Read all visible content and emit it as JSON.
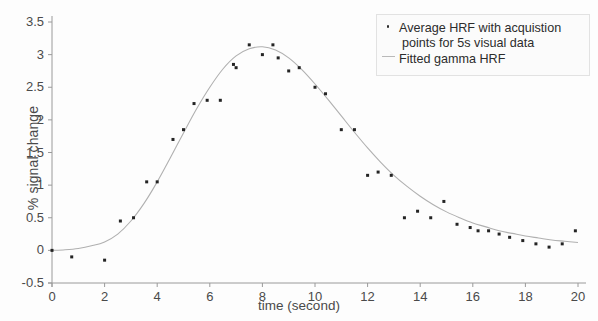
{
  "chart_data": {
    "type": "scatter",
    "title": "",
    "xlabel": "time (second)",
    "ylabel": "% signal change",
    "xlim": [
      0,
      20
    ],
    "ylim": [
      -0.5,
      3.5
    ],
    "xticks": [
      0,
      2,
      4,
      6,
      8,
      10,
      12,
      14,
      16,
      18,
      20
    ],
    "xtick_labels": [
      "0",
      "2",
      "4",
      "6",
      "8",
      "10",
      "12",
      "14",
      "16",
      "18",
      "20"
    ],
    "yticks": [
      -0.5,
      0,
      0.5,
      1,
      1.5,
      2,
      2.5,
      3,
      3.5
    ],
    "ytick_labels": [
      "-0.5",
      "0",
      "0.5",
      "1",
      "1.5",
      "2",
      "2.5",
      "3",
      "3.5"
    ],
    "grid": false,
    "legend_position": "upper right",
    "series": [
      {
        "name": "Average HRF with acquistion points for 5s visual data",
        "type": "scatter",
        "marker": "point",
        "color": "#242424",
        "x": [
          0.0,
          0.75,
          2.0,
          2.6,
          3.1,
          3.6,
          4.0,
          4.6,
          5.0,
          5.4,
          5.9,
          6.4,
          6.9,
          7.0,
          7.5,
          8.0,
          8.4,
          8.6,
          9.0,
          9.4,
          10.0,
          10.4,
          11.0,
          11.5,
          12.0,
          12.4,
          12.9,
          13.4,
          13.9,
          14.4,
          14.9,
          15.4,
          15.9,
          16.2,
          16.6,
          17.0,
          17.4,
          17.9,
          18.4,
          18.9,
          19.4,
          19.9
        ],
        "y": [
          0.0,
          -0.1,
          -0.15,
          0.45,
          0.5,
          1.05,
          1.05,
          1.7,
          1.85,
          2.25,
          2.3,
          2.3,
          2.85,
          2.8,
          3.15,
          3.0,
          3.15,
          2.95,
          2.75,
          2.8,
          2.5,
          2.4,
          1.85,
          1.85,
          1.15,
          1.2,
          1.15,
          0.5,
          0.6,
          0.5,
          0.75,
          0.4,
          0.35,
          0.3,
          0.3,
          0.25,
          0.2,
          0.15,
          0.1,
          0.05,
          0.1,
          0.3
        ]
      },
      {
        "name": "Fitted gamma HRF",
        "type": "line",
        "color": "#b0b0b0",
        "x": [
          0.0,
          0.5,
          1.0,
          1.5,
          2.0,
          2.5,
          3.0,
          3.5,
          4.0,
          4.5,
          5.0,
          5.5,
          6.0,
          6.5,
          7.0,
          7.5,
          8.0,
          8.5,
          9.0,
          9.5,
          10.0,
          10.5,
          11.0,
          11.5,
          12.0,
          12.5,
          13.0,
          13.5,
          14.0,
          14.5,
          15.0,
          15.5,
          16.0,
          16.5,
          17.0,
          17.5,
          18.0,
          18.5,
          19.0,
          19.5,
          20.0
        ],
        "y": [
          0.0,
          0.01,
          0.03,
          0.07,
          0.13,
          0.25,
          0.45,
          0.72,
          1.05,
          1.42,
          1.8,
          2.17,
          2.5,
          2.78,
          2.98,
          3.09,
          3.12,
          3.07,
          2.95,
          2.77,
          2.55,
          2.31,
          2.06,
          1.81,
          1.57,
          1.35,
          1.15,
          0.98,
          0.83,
          0.7,
          0.59,
          0.5,
          0.42,
          0.36,
          0.3,
          0.26,
          0.22,
          0.19,
          0.16,
          0.14,
          0.12
        ]
      }
    ]
  },
  "legend": {
    "entries": [
      {
        "marker": "scatter-dot-marker",
        "line1": "Average HRF with acquistion",
        "line2": "points for 5s visual data"
      },
      {
        "marker": "fitted-line-marker",
        "line1": "Fitted gamma HRF",
        "line2": ""
      }
    ]
  },
  "colors": {
    "scatter": "#242424",
    "fit_line": "#b0b0b0",
    "axis": "#9a9a9a",
    "text": "#4a4a4a",
    "background": "#fdfdfd"
  }
}
